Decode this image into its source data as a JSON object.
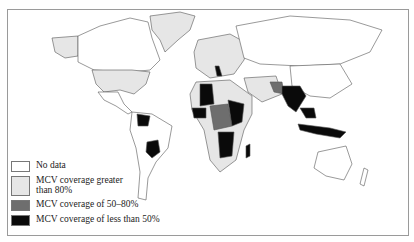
{
  "map": {
    "title": "",
    "subject": "Measles-containing vaccine (MCV) coverage by country",
    "colors": {
      "no_data": "#ffffff",
      "over_80": "#e6e6e6",
      "between_50_80": "#6e6e6e",
      "under_50": "#0a0a0a",
      "border": "#555555"
    }
  },
  "legend": {
    "items": [
      {
        "label": "No data",
        "color": "#ffffff"
      },
      {
        "label": "MCV coverage greater than 80%",
        "color": "#e6e6e6"
      },
      {
        "label": "MCV coverage of 50–80%",
        "color": "#6e6e6e"
      },
      {
        "label": "MCV coverage of less than 50%",
        "color": "#0a0a0a"
      }
    ]
  }
}
